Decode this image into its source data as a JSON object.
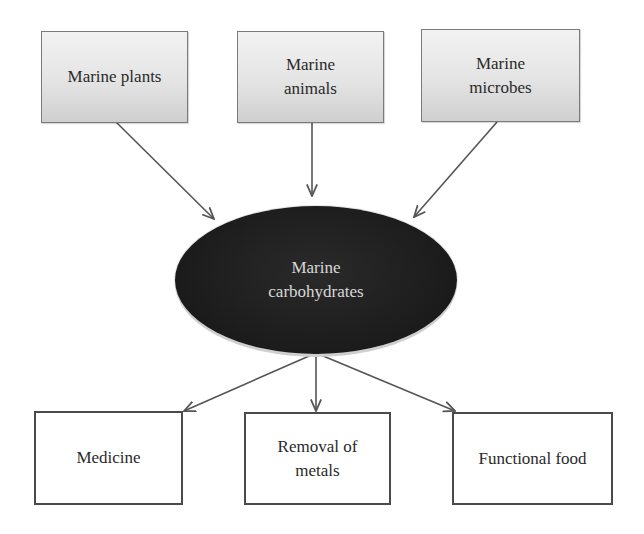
{
  "diagram": {
    "sources": [
      {
        "id": "marine-plants",
        "label": "Marine plants"
      },
      {
        "id": "marine-animals",
        "label": "Marine\nanimals"
      },
      {
        "id": "marine-microbes",
        "label": "Marine\nmicrobes"
      }
    ],
    "center": {
      "id": "marine-carbohydrates",
      "label": "Marine\ncarbohydrates"
    },
    "outputs": [
      {
        "id": "medicine",
        "label": "Medicine"
      },
      {
        "id": "removal-of-metals",
        "label": "Removal of\nmetals"
      },
      {
        "id": "functional-food",
        "label": "Functional food"
      }
    ],
    "edges": [
      {
        "from": "marine-plants",
        "to": "marine-carbohydrates"
      },
      {
        "from": "marine-animals",
        "to": "marine-carbohydrates"
      },
      {
        "from": "marine-microbes",
        "to": "marine-carbohydrates"
      },
      {
        "from": "marine-carbohydrates",
        "to": "medicine"
      },
      {
        "from": "marine-carbohydrates",
        "to": "removal-of-metals"
      },
      {
        "from": "marine-carbohydrates",
        "to": "functional-food"
      }
    ],
    "colors": {
      "source_fill_top": "#f2f2f2",
      "source_fill_bottom": "#cfcfcf",
      "center_fill": "#1b1b1b",
      "center_text": "#d8d8d8",
      "arrow": "#555555",
      "output_border": "#4a4a4a"
    }
  }
}
